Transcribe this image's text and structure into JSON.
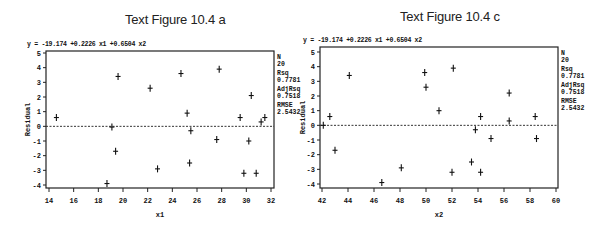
{
  "chart_data": [
    {
      "type": "scatter",
      "title": "Text Figure 10.4 a",
      "equation": "y = -19.174 +0.2226 x1 +0.6504 x2",
      "xlabel": "x1",
      "ylabel": "Residual",
      "xlim": [
        14,
        32
      ],
      "ylim": [
        -4,
        5
      ],
      "xticks": [
        14,
        16,
        18,
        20,
        22,
        24,
        26,
        28,
        30,
        32
      ],
      "yticks": [
        5,
        4,
        3,
        2,
        1,
        0,
        -1,
        -2,
        -3,
        -4
      ],
      "reference_line": {
        "y": 0,
        "style": "dashed"
      },
      "marker": "+",
      "grid": false,
      "stats": [
        {
          "label": "N",
          "value": "20"
        },
        {
          "label": "Rsq",
          "value": "0.7781"
        },
        {
          "label": "AdjRsq",
          "value": "0.7518"
        },
        {
          "label": "RMSE",
          "value": "2.5432"
        }
      ],
      "points": [
        {
          "x": 14.6,
          "y": 0.6
        },
        {
          "x": 19.1,
          "y": -0.05
        },
        {
          "x": 19.6,
          "y": 3.4
        },
        {
          "x": 19.4,
          "y": -1.7
        },
        {
          "x": 18.7,
          "y": -3.9
        },
        {
          "x": 22.2,
          "y": 2.6
        },
        {
          "x": 22.8,
          "y": -2.9
        },
        {
          "x": 24.7,
          "y": 3.6
        },
        {
          "x": 25.2,
          "y": 0.9
        },
        {
          "x": 25.5,
          "y": -0.3
        },
        {
          "x": 25.4,
          "y": -2.5
        },
        {
          "x": 27.8,
          "y": 3.9
        },
        {
          "x": 27.6,
          "y": -0.9
        },
        {
          "x": 29.5,
          "y": 0.6
        },
        {
          "x": 30.4,
          "y": 2.1
        },
        {
          "x": 30.2,
          "y": -1.0
        },
        {
          "x": 29.8,
          "y": -3.2
        },
        {
          "x": 30.8,
          "y": -3.2
        },
        {
          "x": 31.2,
          "y": 0.3
        },
        {
          "x": 31.5,
          "y": 0.6
        }
      ]
    },
    {
      "type": "scatter",
      "title": "Text Figure 10.4 c",
      "equation": "y = -19.174 +0.2226 x1 +0.6504 x2",
      "xlabel": "x2",
      "ylabel": "Residual",
      "xlim": [
        42,
        60
      ],
      "ylim": [
        -4,
        5
      ],
      "xticks": [
        42,
        44,
        46,
        48,
        50,
        52,
        54,
        56,
        58,
        60
      ],
      "yticks": [
        5,
        4,
        3,
        2,
        1,
        0,
        -1,
        -2,
        -3,
        -4
      ],
      "reference_line": {
        "y": 0,
        "style": "dashed"
      },
      "marker": "+",
      "grid": false,
      "stats": [
        {
          "label": "N",
          "value": "20"
        },
        {
          "label": "Rsq",
          "value": "0.7781"
        },
        {
          "label": "AdjRsq",
          "value": "0.7518"
        },
        {
          "label": "RMSE",
          "value": "2.5432"
        }
      ],
      "points": [
        {
          "x": 42.1,
          "y": 0.0
        },
        {
          "x": 42.6,
          "y": 0.6
        },
        {
          "x": 43.0,
          "y": -1.7
        },
        {
          "x": 44.1,
          "y": 3.4
        },
        {
          "x": 46.6,
          "y": -3.9
        },
        {
          "x": 48.1,
          "y": -2.9
        },
        {
          "x": 49.9,
          "y": 3.6
        },
        {
          "x": 50.0,
          "y": 2.6
        },
        {
          "x": 51.0,
          "y": 1.0
        },
        {
          "x": 52.1,
          "y": 3.9
        },
        {
          "x": 52.0,
          "y": -3.2
        },
        {
          "x": 53.5,
          "y": -2.5
        },
        {
          "x": 53.8,
          "y": -0.3
        },
        {
          "x": 54.2,
          "y": 0.6
        },
        {
          "x": 54.2,
          "y": -3.2
        },
        {
          "x": 55.0,
          "y": -0.9
        },
        {
          "x": 56.4,
          "y": 2.2
        },
        {
          "x": 56.4,
          "y": 0.3
        },
        {
          "x": 58.4,
          "y": 0.6
        },
        {
          "x": 58.5,
          "y": -0.9
        }
      ]
    }
  ]
}
